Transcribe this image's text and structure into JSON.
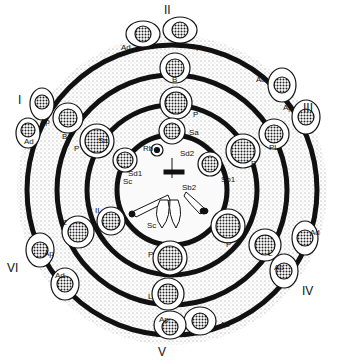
{
  "colors": {
    "ink": "#111111",
    "stipple": "#bdbdbd",
    "background": "#ffffff"
  },
  "stages": [
    {
      "id": "I",
      "x": 18,
      "y": 94
    },
    {
      "id": "II",
      "x": 164,
      "y": 4
    },
    {
      "id": "III",
      "x": 303,
      "y": 102
    },
    {
      "id": "IV",
      "x": 302,
      "y": 285
    },
    {
      "id": "V",
      "x": 158,
      "y": 346
    },
    {
      "id": "VI",
      "x": 7,
      "y": 262
    }
  ],
  "labels": [
    {
      "text": "Ad",
      "x": 121,
      "y": 44
    },
    {
      "text": "Ap",
      "x": 191,
      "y": 43
    },
    {
      "text": "B",
      "x": 172,
      "y": 76
    },
    {
      "text": "P",
      "x": 193,
      "y": 111
    },
    {
      "text": "Sa",
      "x": 189,
      "y": 129
    },
    {
      "text": "Rb",
      "x": 143,
      "y": 145
    },
    {
      "text": "Sd2",
      "x": 180,
      "y": 150
    },
    {
      "text": "Sd1",
      "x": 128,
      "y": 170
    },
    {
      "text": "Sc",
      "x": 123,
      "y": 178
    },
    {
      "text": "Sc",
      "x": 147,
      "y": 222
    },
    {
      "text": "Sb2",
      "x": 182,
      "y": 184
    },
    {
      "text": "Sb1",
      "x": 221,
      "y": 176
    },
    {
      "text": "Sa",
      "x": 98,
      "y": 137
    },
    {
      "text": "P",
      "x": 74,
      "y": 145
    },
    {
      "text": "B",
      "x": 62,
      "y": 133
    },
    {
      "text": "Ap",
      "x": 40,
      "y": 118
    },
    {
      "text": "Ad",
      "x": 24,
      "y": 138
    },
    {
      "text": "Ad",
      "x": 256,
      "y": 76
    },
    {
      "text": "Ap",
      "x": 283,
      "y": 104
    },
    {
      "text": "PL",
      "x": 269,
      "y": 144
    },
    {
      "text": "P",
      "x": 251,
      "y": 160
    },
    {
      "text": "II",
      "x": 95,
      "y": 207
    },
    {
      "text": "Z",
      "x": 62,
      "y": 219
    },
    {
      "text": "Ap",
      "x": 44,
      "y": 250
    },
    {
      "text": "Ad",
      "x": 55,
      "y": 272
    },
    {
      "text": "P",
      "x": 148,
      "y": 251
    },
    {
      "text": "L",
      "x": 148,
      "y": 293
    },
    {
      "text": "P",
      "x": 226,
      "y": 241
    },
    {
      "text": "L",
      "x": 268,
      "y": 250
    },
    {
      "text": "Ad",
      "x": 310,
      "y": 229
    },
    {
      "text": "Ap",
      "x": 274,
      "y": 264
    },
    {
      "text": "Ap",
      "x": 159,
      "y": 316
    },
    {
      "text": "Ad",
      "x": 220,
      "y": 321
    }
  ]
}
